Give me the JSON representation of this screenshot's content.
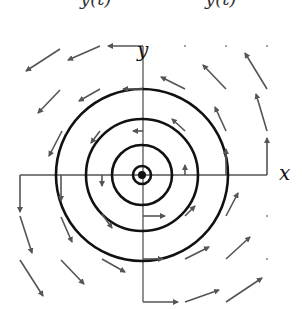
{
  "figure": {
    "title_cut": [
      "y(t)",
      "y(t)"
    ],
    "axes": {
      "x_label": "x",
      "y_label": "y"
    },
    "center": [
      142,
      175
    ],
    "circle_radii": [
      9,
      30,
      56,
      86
    ],
    "center_dot_radius": 4,
    "colors": {
      "circle": "#111111",
      "axis": "#555555",
      "arrow": "#555555"
    },
    "field": "rotational (counter-clockwise), arrow length grows with distance from origin",
    "arrows": [
      [
        143,
        46,
        108,
        46
      ],
      [
        100,
        46,
        68,
        60
      ],
      [
        60,
        49,
        26,
        71
      ],
      [
        100,
        89,
        79,
        101
      ],
      [
        60,
        90,
        38,
        113
      ],
      [
        100,
        131,
        91,
        143
      ],
      [
        62,
        131,
        49,
        156
      ],
      [
        20,
        175,
        20,
        212
      ],
      [
        61,
        175,
        61,
        201
      ],
      [
        102,
        175,
        102,
        186
      ],
      [
        20,
        216,
        32,
        253
      ],
      [
        61,
        217,
        72,
        242
      ],
      [
        102,
        214,
        112,
        228
      ],
      [
        20,
        260,
        43,
        296
      ],
      [
        61,
        260,
        84,
        284
      ],
      [
        102,
        259,
        125,
        272
      ],
      [
        143,
        216,
        165,
        216
      ],
      [
        143,
        259,
        163,
        259
      ],
      [
        143,
        302,
        178,
        302
      ],
      [
        185,
        216,
        195,
        206
      ],
      [
        185,
        259,
        209,
        247
      ],
      [
        185,
        302,
        219,
        290
      ],
      [
        226,
        216,
        238,
        193
      ],
      [
        226,
        259,
        250,
        237
      ],
      [
        226,
        302,
        262,
        278
      ],
      [
        185,
        175,
        185,
        165
      ],
      [
        185,
        131,
        172,
        119
      ],
      [
        185,
        89,
        161,
        77
      ],
      [
        226,
        175,
        226,
        149
      ],
      [
        226,
        131,
        215,
        107
      ],
      [
        226,
        89,
        203,
        65
      ],
      [
        267,
        175,
        267,
        138
      ],
      [
        267,
        131,
        256,
        94
      ],
      [
        267,
        89,
        245,
        53
      ],
      [
        143,
        131,
        133,
        131
      ],
      [
        143,
        89,
        123,
        89
      ]
    ],
    "dots": [
      [
        185,
        46
      ],
      [
        226,
        46
      ],
      [
        267,
        46
      ],
      [
        267,
        216
      ],
      [
        267,
        259
      ]
    ]
  }
}
